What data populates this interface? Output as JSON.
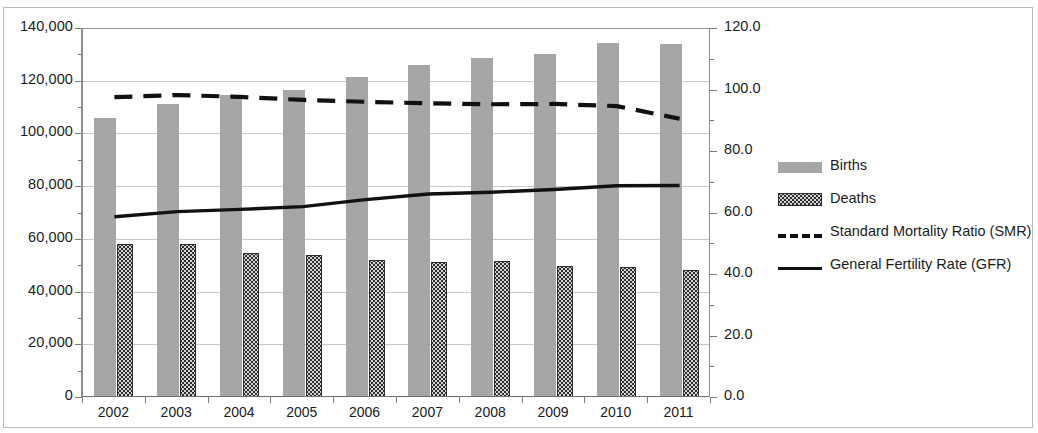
{
  "chart_data": {
    "type": "bar",
    "title": "",
    "subtitle": "",
    "xlabel": "",
    "ylabel": "",
    "grid": true,
    "legend_position": "right",
    "categories": [
      "2002",
      "2003",
      "2004",
      "2005",
      "2006",
      "2007",
      "2008",
      "2009",
      "2010",
      "2011"
    ],
    "left_axis": {
      "label": "",
      "ylim": [
        0,
        140000
      ],
      "tick_values": [
        0,
        20000,
        40000,
        60000,
        80000,
        100000,
        120000,
        140000
      ],
      "tick_labels": [
        "0",
        "20,000",
        "40,000",
        "60,000",
        "80,000",
        "100,000",
        "120,000",
        "140,000"
      ]
    },
    "right_axis": {
      "label": "",
      "ylim": [
        0,
        120
      ],
      "tick_values": [
        0,
        20,
        40,
        60,
        80,
        100,
        120
      ],
      "tick_labels": [
        "0.0",
        "20.0",
        "40.0",
        "60.0",
        "80.0",
        "100.0",
        "120.0"
      ]
    },
    "series": [
      {
        "name": "Births",
        "type": "bar",
        "axis": "left",
        "color": "#a6a6a6",
        "values": [
          106000,
          111000,
          114500,
          116500,
          121500,
          126000,
          128500,
          130000,
          134500,
          134000
        ]
      },
      {
        "name": "Deaths",
        "type": "bar",
        "axis": "left",
        "color": "#d4d4d4",
        "pattern": "dotted",
        "values": [
          58000,
          58200,
          54700,
          53700,
          52000,
          51300,
          51600,
          49700,
          49300,
          48200
        ]
      },
      {
        "name": "Standard Mortality Ratio (SMR)",
        "type": "line",
        "style": "dashed",
        "axis": "right",
        "color": "#111111",
        "values": [
          97.5,
          98.2,
          97.6,
          96.6,
          96.0,
          95.5,
          95.2,
          95.3,
          94.6,
          90.5
        ]
      },
      {
        "name": "General Fertility Rate (GFR)",
        "type": "line",
        "style": "solid",
        "axis": "right",
        "color": "#111111",
        "values": [
          58.6,
          60.3,
          61.0,
          61.9,
          64.2,
          66.0,
          66.6,
          67.5,
          68.7,
          68.8
        ]
      }
    ]
  },
  "legend": {
    "items": [
      {
        "label": "Births",
        "key": "births-swatch"
      },
      {
        "label": "Deaths",
        "key": "deaths-swatch"
      },
      {
        "label": "Standard Mortality Ratio (SMR)",
        "key": "smr-dashed-line-swatch"
      },
      {
        "label": "General Fertility Rate (GFR)",
        "key": "gfr-solid-line-swatch"
      }
    ]
  }
}
